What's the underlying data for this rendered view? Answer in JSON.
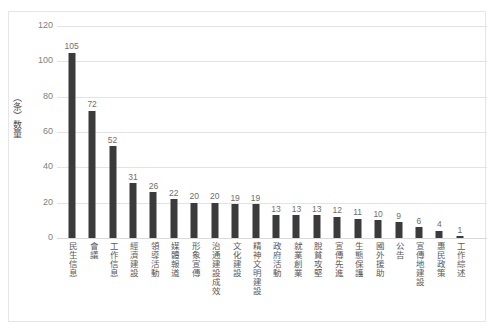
{
  "chart_data": {
    "type": "bar",
    "title": "",
    "subtitle": "",
    "xlabel": "",
    "ylabel": "（条）数量",
    "ylim": [
      0,
      120
    ],
    "ytick_labels": [
      "0",
      "20",
      "40",
      "60",
      "80",
      "100",
      "120"
    ],
    "ytick_values": [
      0,
      20,
      40,
      60,
      80,
      100,
      120
    ],
    "grid": true,
    "legend": "none",
    "bar_color": "#3b3b3b",
    "gridline_color": "#e3e3e3",
    "axis_text_color": "#808080",
    "categories": [
      "民生信息",
      "會議",
      "工作信息",
      "經濟建設",
      "領導活動",
      "媒體報道",
      "形象宣傳",
      "治通建設成效",
      "文化建設",
      "精神文明建設",
      "政府活動",
      "就業創業",
      "脫貧攻堅",
      "宣傳先進",
      "生態保護",
      "國外援助",
      "公告",
      "宣傳地建設",
      "惠民政策",
      "工作綜述"
    ],
    "values": [
      105,
      72,
      52,
      31,
      26,
      22,
      20,
      20,
      19,
      19,
      13,
      13,
      13,
      12,
      11,
      10,
      9,
      6,
      4,
      1
    ],
    "value_labels": [
      "105",
      "72",
      "52",
      "31",
      "26",
      "22",
      "20",
      "20",
      "19",
      "19",
      "13",
      "13",
      "13",
      "12",
      "11",
      "10",
      "9",
      "6",
      "4",
      "1"
    ]
  }
}
